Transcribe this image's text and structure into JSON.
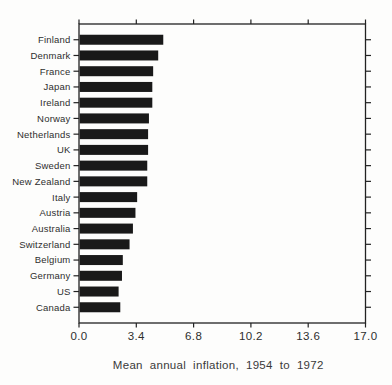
{
  "figure": {
    "kind": "scanned-statistical-figure",
    "background": "#fdfdfc"
  },
  "chart_data": {
    "type": "bar",
    "orientation": "horizontal",
    "title": "",
    "xlabel": "Mean annual inflation, 1954 to 1972",
    "ylabel": "",
    "categories": [
      "Finland",
      "Denmark",
      "France",
      "Japan",
      "Ireland",
      "Norway",
      "Netherlands",
      "UK",
      "Sweden",
      "New Zealand",
      "Italy",
      "Austria",
      "Australia",
      "Switzerland",
      "Belgium",
      "Germany",
      "US",
      "Canada"
    ],
    "values": [
      5.0,
      4.7,
      4.4,
      4.35,
      4.35,
      4.15,
      4.1,
      4.1,
      4.05,
      4.05,
      3.45,
      3.35,
      3.2,
      3.0,
      2.6,
      2.55,
      2.35,
      2.45
    ],
    "xlim": [
      0,
      17
    ],
    "xticks": [
      0.0,
      3.4,
      6.8,
      10.2,
      13.6,
      17.0
    ],
    "xtick_labels": [
      "0.0",
      "3.4",
      "6.8",
      "10.2",
      "13.6",
      "17.0"
    ],
    "grid": "off",
    "legend": "none",
    "frame": "full-box with outward ticks on all four sides",
    "bar_color": "#191919",
    "frame_color": "#222222",
    "label_color": "#2e2e2e"
  }
}
